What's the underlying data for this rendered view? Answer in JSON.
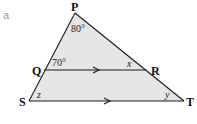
{
  "part_label": "a",
  "diagram": {
    "fill_color": "#e6e6e6",
    "line_color": "#1a1a1a",
    "vertices": {
      "P": {
        "label": "P",
        "x": 75,
        "y": 13
      },
      "Q": {
        "label": "Q",
        "x": 44,
        "y": 70
      },
      "R": {
        "label": "R",
        "x": 146,
        "y": 70
      },
      "S": {
        "label": "S",
        "x": 29,
        "y": 101
      },
      "T": {
        "label": "T",
        "x": 184,
        "y": 101
      }
    },
    "angles": {
      "P": "80°",
      "PQR": "70°",
      "QRP": "x",
      "TSP": "z",
      "STP": "y"
    },
    "parallel_lines": [
      "QR",
      "ST"
    ]
  }
}
